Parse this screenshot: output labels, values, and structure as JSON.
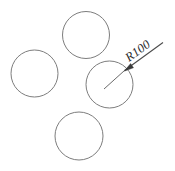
{
  "drawing": {
    "title": "Circle pattern with radius dimension",
    "background_color": "#ffffff",
    "line_color": "#7d7d7d",
    "text_color": "#2b2b2b",
    "width": 175,
    "height": 171,
    "dimension": {
      "label": "R100",
      "type": "radius",
      "value": 100,
      "prefix": "R",
      "text_rotation_deg": -30,
      "leader": {
        "start_x": 104,
        "start_y": 89,
        "arrow_x": 124.5,
        "arrow_y": 70.5,
        "landing_end_x": 163,
        "landing_end_y": 42.5
      }
    },
    "circles": [
      {
        "name": "circle-top",
        "cx": 86,
        "cy": 35,
        "r": 23.5
      },
      {
        "name": "circle-left",
        "cx": 34.5,
        "cy": 73.5,
        "r": 23.5
      },
      {
        "name": "circle-center-right",
        "cx": 109.5,
        "cy": 84.5,
        "r": 23.5
      },
      {
        "name": "circle-bottom",
        "cx": 79,
        "cy": 136,
        "r": 24
      }
    ]
  }
}
